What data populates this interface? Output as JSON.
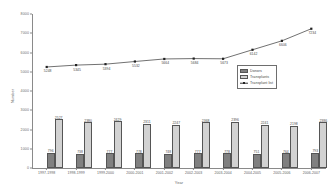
{
  "chart_data": {
    "type": "bar",
    "title": "",
    "xlabel": "Year",
    "ylabel": "Number",
    "ylim": [
      0,
      8000
    ],
    "ytick_values": [
      0,
      1000,
      2000,
      3000,
      4000,
      5000,
      6000,
      7000,
      8000
    ],
    "ytick_labels": [
      "0",
      "1000",
      "2000",
      "3000",
      "4000",
      "5000",
      "6000",
      "7000",
      "8000"
    ],
    "grid": false,
    "legend_position": "center-right",
    "categories": [
      "1997-1998",
      "1998-1999",
      "1999-2000",
      "2000-2001",
      "2001-2002",
      "2002-2003",
      "2003-2004",
      "2004-2005",
      "2005-2006",
      "2006-2007"
    ],
    "series": [
      {
        "name": "Donors",
        "render": "bar",
        "color": "#808080",
        "values": [
          796,
          738,
          777,
          778,
          748,
          777,
          778,
          751,
          764,
          793
        ]
      },
      {
        "name": "Transplants",
        "render": "bar",
        "color": "#d2d2d2",
        "values": [
          2527,
          2380,
          2429,
          2311,
          2247,
          2368,
          2396,
          2241,
          2198,
          2386
        ]
      },
      {
        "name": "Transplant list",
        "render": "line",
        "color": "#333333",
        "values": [
          5248,
          5345,
          5394,
          5532,
          5664,
          5684,
          5673,
          6142,
          6606,
          7234
        ]
      }
    ]
  },
  "legend": {
    "items": [
      {
        "label": "Donors",
        "marker": "swatch-dark"
      },
      {
        "label": "Transplants",
        "marker": "swatch-light"
      },
      {
        "label": "Transplant list",
        "marker": "line-marker"
      }
    ]
  }
}
